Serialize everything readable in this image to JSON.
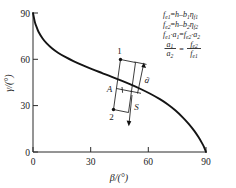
{
  "chart_data": {
    "type": "line",
    "title": "",
    "xlabel": "β/(°)",
    "ylabel": "γ/(°)",
    "xlim": [
      0,
      90
    ],
    "ylim": [
      0,
      90
    ],
    "xticks": [
      "0",
      "30",
      "60",
      "90"
    ],
    "yticks": [
      "0",
      "30",
      "60",
      "90"
    ],
    "xtick_values": [
      0,
      30,
      60,
      90
    ],
    "ytick_values": [
      0,
      30,
      60,
      90
    ],
    "grid": false,
    "legend": "none",
    "series": [
      {
        "name": "γ vs β",
        "x": [
          0,
          1,
          2,
          3,
          5,
          7,
          10,
          13,
          17,
          21,
          26,
          31,
          36,
          41,
          46,
          51,
          56,
          61,
          66,
          70,
          74,
          78,
          81,
          84,
          86,
          88,
          89,
          90
        ],
        "y": [
          90,
          84,
          80.5,
          77.5,
          73.5,
          70.5,
          67,
          64.3,
          61.4,
          58.9,
          56.1,
          53.5,
          51.1,
          48.7,
          46.2,
          43.6,
          40.8,
          37.7,
          34.2,
          30.9,
          27.0,
          22.3,
          18.2,
          13.5,
          9.8,
          5.6,
          3.2,
          0
        ]
      }
    ]
  },
  "annotations": {
    "point_1": {
      "label": "1",
      "beta": 62,
      "gamma": 60
    },
    "point_2": {
      "label": "2",
      "beta": 53,
      "gamma": 30
    },
    "point_A": {
      "label": "A",
      "beta": 55.5,
      "gamma": 41.5
    },
    "vector_a": {
      "label": "ā"
    },
    "vector_s": {
      "label": "S"
    }
  },
  "equations": {
    "line1": {
      "lhs_var": "f",
      "lhs_sub": "e1",
      "eq": "=",
      "rhs": "h–b",
      "rhs_sub1": "1",
      "rhs_eta": "η",
      "rhs_sub2": "f1"
    },
    "line2": {
      "lhs_var": "f",
      "lhs_sub": "e2",
      "eq": "=",
      "rhs": "h–b",
      "rhs_sub1": "2",
      "rhs_eta": "η",
      "rhs_sub2": "f2"
    },
    "line3": {
      "t1": "f",
      "s1": "e1",
      "t2": "·a",
      "s2": "1",
      "eq": "=",
      "t3": "f",
      "s3": "e2",
      "t4": "·a",
      "s4": "2"
    },
    "line4": {
      "num_left": "a",
      "num_left_sub": "1",
      "den_left": "a",
      "den_left_sub": "2",
      "eq": "=",
      "num_right": "f",
      "num_right_sub": "e2",
      "den_right": "f",
      "den_right_sub": "e1"
    }
  }
}
